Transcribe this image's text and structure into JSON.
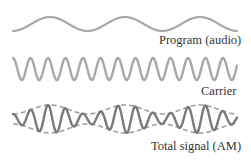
{
  "diagram": {
    "colors": {
      "program": "#a8a8a8",
      "carrier": "#a8a8a8",
      "total": "#7a7a7a",
      "envelope": "#a0a0a0",
      "text": "#333333"
    },
    "waves": [
      {
        "id": "program",
        "label": "Program (audio)",
        "center_y": 24,
        "amplitude": 7,
        "period": 75,
        "x_start": 13,
        "x_end": 237
      },
      {
        "id": "carrier",
        "label": "Carrier",
        "center_y": 69,
        "amplitude": 11,
        "period": 17.5,
        "x_start": 13,
        "x_end": 237
      },
      {
        "id": "total",
        "label": "Total signal (AM)",
        "center_y": 119,
        "amplitude_max": 14,
        "amplitude_min": 5,
        "x_start": 13,
        "x_end": 237
      }
    ],
    "labels": {
      "program": "Program (audio)",
      "carrier": "Carrier",
      "total": "Total signal (AM)"
    }
  }
}
